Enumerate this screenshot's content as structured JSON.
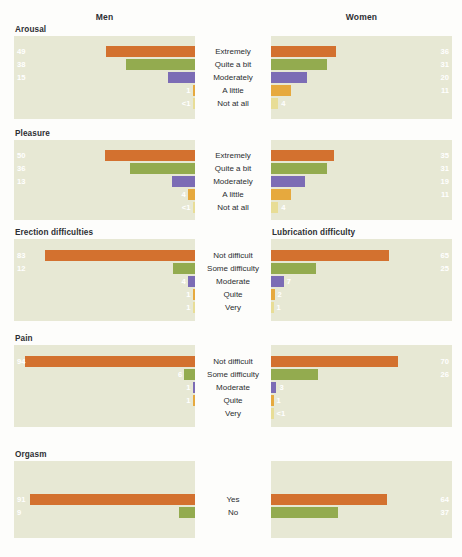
{
  "header": {
    "men": "Men",
    "women": "Women"
  },
  "palette": {
    "page_background": "#fdfdfb",
    "panel_background": "#e7e8d4",
    "text": "#2d2f33",
    "orange": "#d3712f",
    "green": "#93ab4f",
    "purple": "#7c6cb5",
    "amber": "#e6a93e",
    "pale": "#e8dd96"
  },
  "chart_data": {
    "type": "bar",
    "title": "",
    "xlabel": "",
    "ylabel": "",
    "orientation": "horizontal-diverging",
    "xlim": [
      0,
      100
    ],
    "grid": false,
    "legend": "none",
    "columns": [
      "Men",
      "Women"
    ],
    "units": "percent",
    "sections": [
      {
        "id": "arousal",
        "left_title": "Arousal",
        "right_title": "",
        "categories": [
          "Extremely",
          "Quite a bit",
          "Moderately",
          "A little",
          "Not at all"
        ],
        "colors": [
          "orange",
          "green",
          "purple",
          "amber",
          "pale"
        ],
        "series": [
          {
            "name": "Men",
            "values": [
              49,
              38,
              15,
              1,
              0.5
            ],
            "labels": [
              "49",
              "38",
              "15",
              "1",
              "<1"
            ]
          },
          {
            "name": "Women",
            "values": [
              36,
              31,
              20,
              11,
              4
            ],
            "labels": [
              "36",
              "31",
              "20",
              "11",
              "4"
            ]
          }
        ]
      },
      {
        "id": "pleasure",
        "left_title": "Pleasure",
        "right_title": "",
        "categories": [
          "Extremely",
          "Quite a bit",
          "Moderately",
          "A little",
          "Not at all"
        ],
        "colors": [
          "orange",
          "green",
          "purple",
          "amber",
          "pale"
        ],
        "series": [
          {
            "name": "Men",
            "values": [
              50,
              36,
              13,
              4,
              0.5
            ],
            "labels": [
              "50",
              "36",
              "13",
              "4",
              "<1"
            ]
          },
          {
            "name": "Women",
            "values": [
              35,
              31,
              19,
              11,
              4
            ],
            "labels": [
              "35",
              "31",
              "19",
              "11",
              "4"
            ]
          }
        ]
      },
      {
        "id": "difficulty",
        "left_title": "Erection difficulties",
        "right_title": "Lubrication difficulty",
        "categories": [
          "Not difficult",
          "Some difficulty",
          "Moderate",
          "Quite",
          "Very"
        ],
        "colors": [
          "orange",
          "green",
          "purple",
          "amber",
          "pale"
        ],
        "series": [
          {
            "name": "Men",
            "values": [
              83,
              12,
              4,
              1,
              1
            ],
            "labels": [
              "83",
              "12",
              "4",
              "1",
              "1"
            ]
          },
          {
            "name": "Women",
            "values": [
              65,
              25,
              7,
              2,
              1
            ],
            "labels": [
              "65",
              "25",
              "7",
              "2",
              "1"
            ]
          }
        ]
      },
      {
        "id": "pain",
        "left_title": "Pain",
        "right_title": "",
        "categories": [
          "Not difficult",
          "Some difficulty",
          "Moderate",
          "Quite",
          "Very"
        ],
        "colors": [
          "orange",
          "green",
          "purple",
          "amber",
          "pale"
        ],
        "series": [
          {
            "name": "Men",
            "values": [
              94,
              6,
              1,
              1,
              0
            ],
            "labels": [
              "94",
              "6",
              "1",
              "1",
              ""
            ]
          },
          {
            "name": "Women",
            "values": [
              70,
              26,
              3,
              1,
              0.5
            ],
            "labels": [
              "70",
              "26",
              "3",
              "1",
              "<1"
            ]
          }
        ]
      },
      {
        "id": "orgasm",
        "left_title": "Orgasm",
        "right_title": "",
        "categories": [
          "Yes",
          "No"
        ],
        "colors": [
          "orange",
          "green"
        ],
        "series": [
          {
            "name": "Men",
            "values": [
              91,
              9
            ],
            "labels": [
              "91",
              "9"
            ]
          },
          {
            "name": "Women",
            "values": [
              64,
              37
            ],
            "labels": [
              "64",
              "37"
            ]
          }
        ]
      }
    ]
  }
}
